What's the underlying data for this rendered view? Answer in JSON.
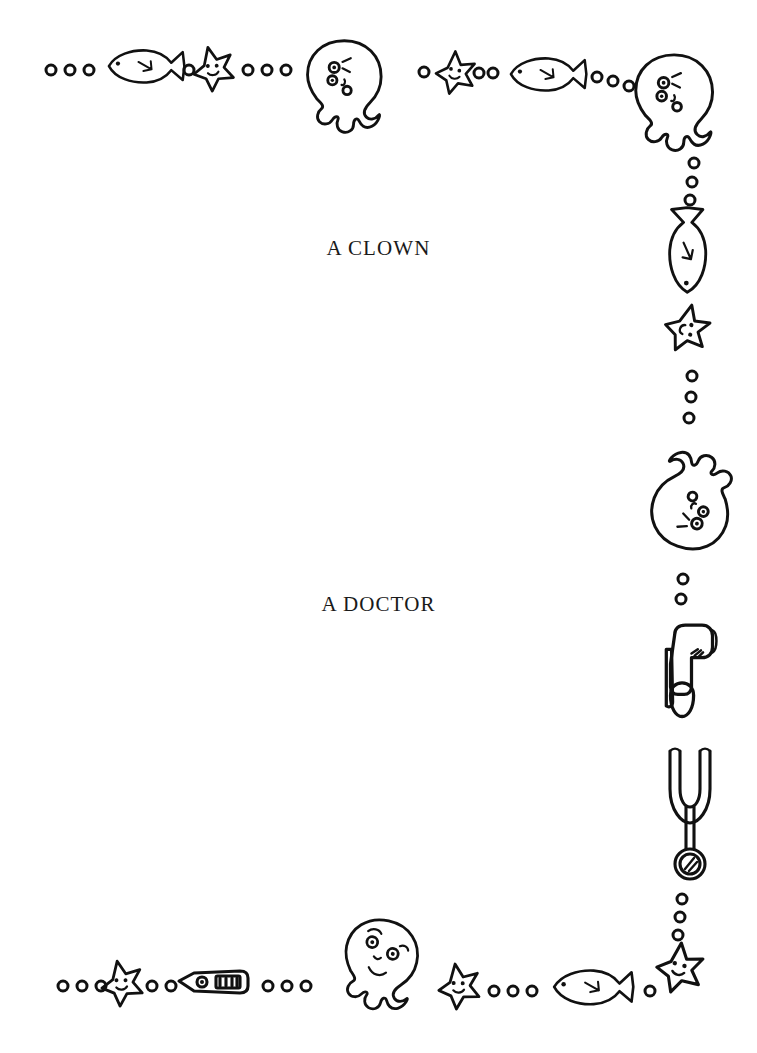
{
  "page": {
    "background_color": "#ffffff",
    "ink_color": "#111111",
    "width": 757,
    "height": 1053
  },
  "labels": {
    "first": "A CLOWN",
    "second": "A DOCTOR"
  },
  "border": {
    "description": "Hand drawn sea-life and medical border frame",
    "top_row": [
      {
        "icon": "bubble-icon",
        "x": 51,
        "y": 70,
        "r": 5
      },
      {
        "icon": "bubble-icon",
        "x": 70,
        "y": 70,
        "r": 5
      },
      {
        "icon": "bubble-icon",
        "x": 89,
        "y": 70,
        "r": 5
      },
      {
        "icon": "fish-icon",
        "x": 108,
        "y": 48,
        "w": 78,
        "h": 44,
        "dir": "left"
      },
      {
        "icon": "bubble-icon",
        "x": 189,
        "y": 70,
        "r": 5
      },
      {
        "icon": "starfish-icon",
        "x": 192,
        "y": 48,
        "w": 42,
        "h": 42,
        "rot": -8
      },
      {
        "icon": "bubble-icon",
        "x": 248,
        "y": 70,
        "r": 5
      },
      {
        "icon": "bubble-icon",
        "x": 267,
        "y": 70,
        "r": 5
      },
      {
        "icon": "bubble-icon",
        "x": 286,
        "y": 70,
        "r": 5
      },
      {
        "icon": "octopus-icon",
        "x": 300,
        "y": 38,
        "w": 92,
        "h": 100,
        "rot": 0
      },
      {
        "icon": "bubble-icon",
        "x": 424,
        "y": 72,
        "r": 5
      },
      {
        "icon": "starfish-icon",
        "x": 432,
        "y": 52,
        "w": 42,
        "h": 40,
        "rot": 6
      },
      {
        "icon": "bubble-icon",
        "x": 481,
        "y": 72,
        "r": 5
      },
      {
        "icon": "bubble-icon",
        "x": 495,
        "y": 72,
        "r": 5
      },
      {
        "icon": "bubble-icon",
        "x": 509,
        "y": 72,
        "r": 5
      },
      {
        "icon": "fish-icon",
        "x": 508,
        "y": 55,
        "w": 80,
        "h": 42,
        "dir": "left"
      },
      {
        "icon": "bubble-icon",
        "x": 597,
        "y": 76,
        "r": 5
      },
      {
        "icon": "bubble-icon",
        "x": 613,
        "y": 80,
        "r": 5
      },
      {
        "icon": "bubble-icon",
        "x": 629,
        "y": 84,
        "r": 5
      },
      {
        "icon": "octopus-icon",
        "x": 628,
        "y": 52,
        "w": 92,
        "h": 100,
        "rot": 0
      }
    ],
    "right_column": [
      {
        "icon": "bubble-icon",
        "x": 693,
        "y": 162,
        "r": 5
      },
      {
        "icon": "bubble-icon",
        "x": 691,
        "y": 180,
        "r": 5
      },
      {
        "icon": "bubble-icon",
        "x": 689,
        "y": 198,
        "r": 5
      },
      {
        "icon": "fish-icon",
        "x": 668,
        "y": 202,
        "w": 44,
        "h": 82,
        "dir": "down"
      },
      {
        "icon": "starfish-icon",
        "x": 663,
        "y": 305,
        "w": 46,
        "h": 46,
        "rot": 18
      },
      {
        "icon": "bubble-icon",
        "x": 691,
        "y": 375,
        "r": 5
      },
      {
        "icon": "bubble-icon",
        "x": 690,
        "y": 396,
        "r": 5
      },
      {
        "icon": "bubble-icon",
        "x": 688,
        "y": 417,
        "r": 5
      },
      {
        "icon": "octopus-icon",
        "x": 620,
        "y": 452,
        "w": 98,
        "h": 112,
        "rot": 200
      },
      {
        "icon": "bubble-icon",
        "x": 683,
        "y": 578,
        "r": 5
      },
      {
        "icon": "bubble-icon",
        "x": 681,
        "y": 598,
        "r": 5
      },
      {
        "icon": "otoscope-icon",
        "x": 660,
        "y": 622,
        "w": 56,
        "h": 110
      },
      {
        "icon": "stethoscope-icon",
        "x": 660,
        "y": 745,
        "w": 58,
        "h": 140
      },
      {
        "icon": "bubble-icon",
        "x": 681,
        "y": 898,
        "r": 5
      },
      {
        "icon": "bubble-icon",
        "x": 679,
        "y": 916,
        "r": 5
      },
      {
        "icon": "bubble-icon",
        "x": 677,
        "y": 934,
        "r": 5
      }
    ],
    "bottom_row": [
      {
        "icon": "bubble-icon",
        "x": 63,
        "y": 985,
        "r": 5
      },
      {
        "icon": "bubble-icon",
        "x": 82,
        "y": 985,
        "r": 5
      },
      {
        "icon": "bubble-icon",
        "x": 101,
        "y": 985,
        "r": 5
      },
      {
        "icon": "starfish-icon",
        "x": 101,
        "y": 962,
        "w": 44,
        "h": 44,
        "rot": -6
      },
      {
        "icon": "bubble-icon",
        "x": 152,
        "y": 985,
        "r": 5
      },
      {
        "icon": "bubble-icon",
        "x": 171,
        "y": 985,
        "r": 5
      },
      {
        "icon": "thermometer-icon",
        "x": 176,
        "y": 963,
        "w": 74,
        "h": 28
      },
      {
        "icon": "bubble-icon",
        "x": 268,
        "y": 985,
        "r": 5
      },
      {
        "icon": "bubble-icon",
        "x": 287,
        "y": 985,
        "r": 5
      },
      {
        "icon": "bubble-icon",
        "x": 306,
        "y": 985,
        "r": 5
      },
      {
        "icon": "octopus-icon",
        "x": 337,
        "y": 920,
        "w": 88,
        "h": 96,
        "rot": 12
      },
      {
        "icon": "starfish-icon",
        "x": 437,
        "y": 964,
        "w": 44,
        "h": 44,
        "rot": -4
      },
      {
        "icon": "bubble-icon",
        "x": 494,
        "y": 990,
        "r": 5
      },
      {
        "icon": "bubble-icon",
        "x": 513,
        "y": 990,
        "r": 5
      },
      {
        "icon": "bubble-icon",
        "x": 532,
        "y": 990,
        "r": 5
      },
      {
        "icon": "fish-icon",
        "x": 551,
        "y": 966,
        "w": 84,
        "h": 44,
        "dir": "left"
      },
      {
        "icon": "bubble-icon",
        "x": 650,
        "y": 990,
        "r": 5
      },
      {
        "icon": "starfish-icon",
        "x": 657,
        "y": 944,
        "w": 48,
        "h": 48,
        "rot": 10
      }
    ]
  }
}
